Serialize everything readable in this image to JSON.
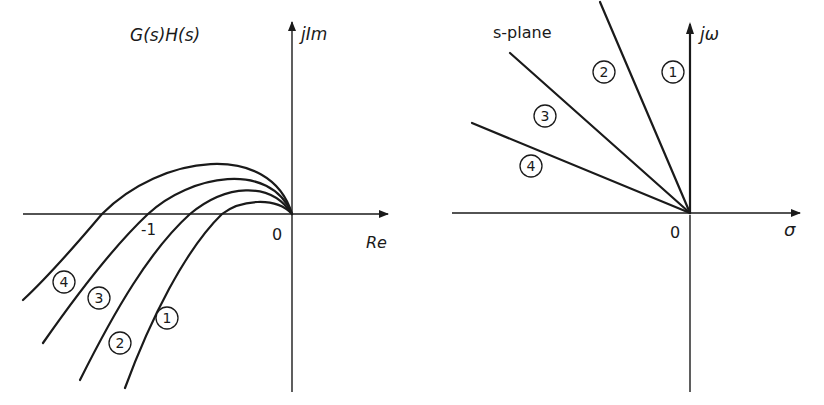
{
  "left_panel": {
    "title": "G(s)H(s)",
    "imag_axis_label": "jIm",
    "real_axis_label": "Re",
    "origin_label": "0",
    "tick_label_minus_one": "-1",
    "curves": [
      {
        "id": "1",
        "label": "1",
        "path": "M125,388 C150,320 185,250 222,214 C240,200 275,196 292,214"
      },
      {
        "id": "2",
        "label": "2",
        "path": "M80,380 C115,310 150,250 190,214 C225,185 270,180 292,214"
      },
      {
        "id": "3",
        "label": "3",
        "path": "M43,343 C80,290 115,245 148,214 C190,175 270,160 292,214"
      },
      {
        "id": "4",
        "label": "4",
        "path": "M23,300 C50,275 80,240 102,214 C160,155 270,140 292,214"
      }
    ],
    "curve_labels": [
      {
        "text": "4",
        "x": 64,
        "y": 282
      },
      {
        "text": "3",
        "x": 99,
        "y": 298
      },
      {
        "text": "2",
        "x": 120,
        "y": 343
      },
      {
        "text": "1",
        "x": 167,
        "y": 318
      }
    ]
  },
  "right_panel": {
    "title": "s-plane",
    "imag_axis_label": "jω",
    "real_axis_label": "σ",
    "origin_label": "0",
    "rays": [
      {
        "id": "1",
        "label": "1",
        "end": [
          690,
          25
        ]
      },
      {
        "id": "2",
        "label": "2",
        "end": [
          600,
          2
        ]
      },
      {
        "id": "3",
        "label": "3",
        "end": [
          510,
          53
        ]
      },
      {
        "id": "4",
        "label": "4",
        "end": [
          472,
          123
        ]
      }
    ],
    "ray_labels": [
      {
        "text": "1",
        "x": 673,
        "y": 72
      },
      {
        "text": "2",
        "x": 604,
        "y": 72
      },
      {
        "text": "3",
        "x": 545,
        "y": 116
      },
      {
        "text": "4",
        "x": 531,
        "y": 166
      }
    ]
  }
}
